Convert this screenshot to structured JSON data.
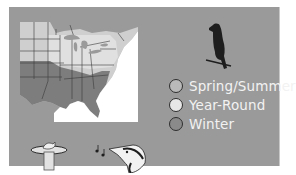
{
  "map": {
    "region": "Eastern United States range map",
    "colors": {
      "background": "#9a9a9a",
      "ocean": "#ffffff",
      "spring_summer": "#c9c9c9",
      "year_round": "#d9d9d9",
      "winter": "#7d7d7d",
      "state_lines": "#3a3a3a"
    }
  },
  "legend": {
    "items": [
      {
        "label": "Spring/Summer",
        "color": "#b9b9b9"
      },
      {
        "label": "Year-Round",
        "color": "#e6e6e6"
      },
      {
        "label": "Winter",
        "color": "#8a8a8a"
      }
    ]
  },
  "icons": {
    "bird": "bird-silhouette-icon",
    "bath": "bird-bath-icon",
    "song": "bird-song-icon"
  }
}
